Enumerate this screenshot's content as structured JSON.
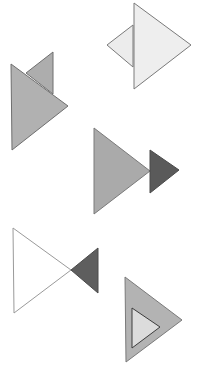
{
  "canvas": {
    "width": 201,
    "height": 375,
    "background": "#ffffff"
  },
  "colors": {
    "white": "#ffffff",
    "very_light": "#efefef",
    "light": "#e8e8e8",
    "medium": "#b3b3b3",
    "medium_dark": "#a6a6a6",
    "dark": "#5c5c5c",
    "outline": "#6f6f6f",
    "outline_light": "#9a9a9a",
    "inner_fill": "#dadada"
  },
  "figures": [
    {
      "id": "figure-1",
      "description": "Large light triangle overlapping a smaller light triangle on its left",
      "shapes": [
        {
          "name": "small-back-triangle",
          "points": "107,45 133,25 133,67",
          "fill": "#ececec",
          "stroke": "#7a7a7a"
        },
        {
          "name": "large-front-triangle",
          "points": "134,3 191,45 134,89",
          "fill": "#eeeeee",
          "stroke": "#7a7a7a"
        }
      ]
    },
    {
      "id": "figure-2",
      "description": "Large medium-gray triangle in front of a smaller medium-gray triangle behind it",
      "shapes": [
        {
          "name": "small-back-triangle",
          "points": "53,52 26,73 53,94",
          "fill": "#adadad",
          "stroke": "#6f6f6f"
        },
        {
          "name": "large-front-triangle",
          "points": "11,64 68,106 12,150",
          "fill": "#b1b1b1",
          "stroke": "#6f6f6f"
        }
      ]
    },
    {
      "id": "figure-3",
      "description": "Large medium-gray triangle with a small dark triangle at its tip",
      "shapes": [
        {
          "name": "large-triangle",
          "points": "94,128 150,171 94,214",
          "fill": "#aaaaaa",
          "stroke": "#7a7a7a"
        },
        {
          "name": "small-dark-triangle",
          "points": "150,150 179,170 150,193",
          "fill": "#5a5a5a",
          "stroke": "#4a4a4a"
        }
      ]
    },
    {
      "id": "figure-4",
      "description": "Large white outlined triangle meeting a small dark triangle tip-to-tip (bow-tie)",
      "shapes": [
        {
          "name": "large-white-triangle",
          "points": "13,228 71,270 14,313",
          "fill": "#ffffff",
          "stroke": "#9a9a9a"
        },
        {
          "name": "small-dark-triangle",
          "points": "71,270 98,248 98,293",
          "fill": "#5e5e5e",
          "stroke": "#4a4a4a"
        }
      ]
    },
    {
      "id": "figure-5",
      "description": "Large medium-gray triangle containing a small light triangle inside",
      "shapes": [
        {
          "name": "large-outer-triangle",
          "points": "125,277 182,320 126,362",
          "fill": "#b3b3b3",
          "stroke": "#7a7a7a"
        },
        {
          "name": "small-inner-triangle",
          "points": "132,308 160,327 132,348",
          "fill": "#dcdcdc",
          "stroke": "#3c3c3c"
        }
      ]
    }
  ]
}
